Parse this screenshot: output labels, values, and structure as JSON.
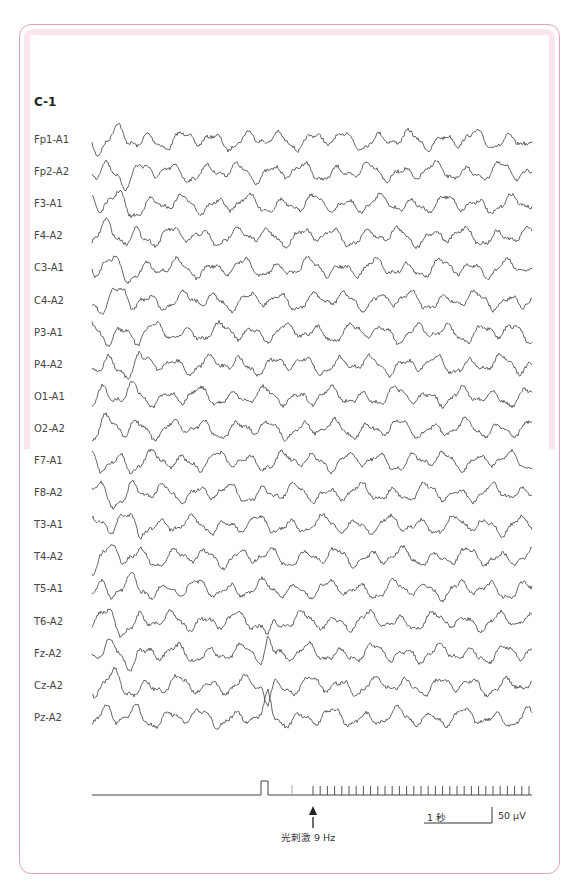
{
  "header": {
    "running_text": ""
  },
  "figure": {
    "id": "C-1",
    "channels": [
      "Fp1-A1",
      "Fp2-A2",
      "F3-A1",
      "F4-A2",
      "C3-A1",
      "C4-A2",
      "P3-A1",
      "P4-A2",
      "O1-A1",
      "O2-A2",
      "F7-A1",
      "F8-A2",
      "T3-A1",
      "T4-A2",
      "T5-A1",
      "T6-A2",
      "Fz-A2",
      "Cz-A2",
      "Pz-A2"
    ],
    "stimulus": {
      "label": "光刺激 9 Hz",
      "frequency_hz": 9,
      "marker": "arrow-up"
    },
    "scale": {
      "time_label": "1 秒",
      "amplitude_label": "50 μV"
    }
  },
  "colors": {
    "trace": "#555555",
    "frame_border": "#e7a3b6",
    "frame_band": "#fbe6ee"
  }
}
